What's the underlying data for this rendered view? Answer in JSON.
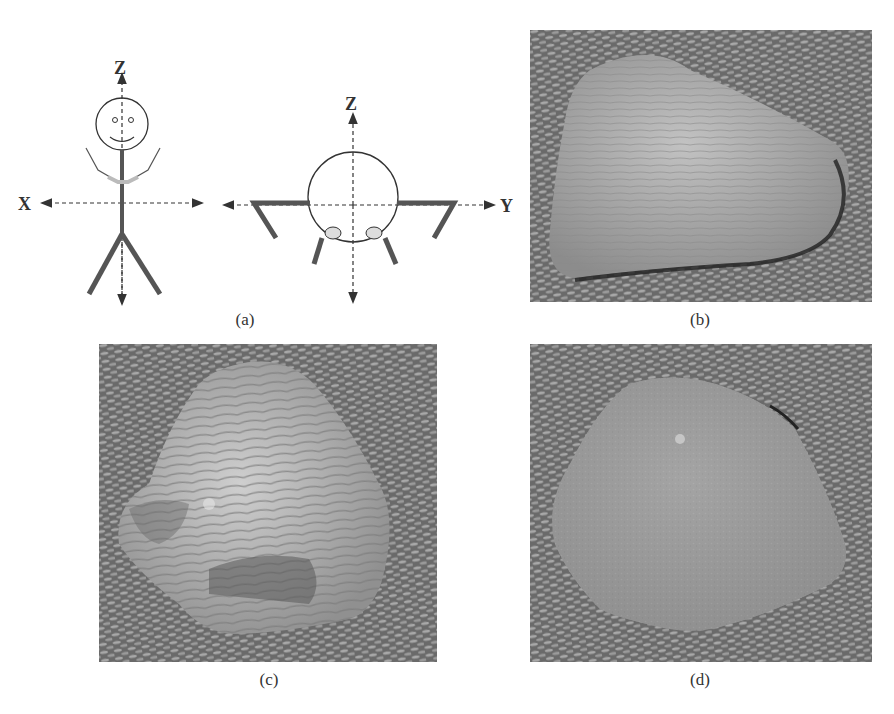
{
  "figure": {
    "panels": [
      {
        "id": "a",
        "caption": "(a)",
        "type": "diagram",
        "description": "Stick figure coordinate axes: front view (X-Z) and top view (Y-Z)",
        "left_view": {
          "axis_labels": {
            "vertical": "Z",
            "horizontal": "X"
          }
        },
        "right_view": {
          "axis_labels": {
            "vertical": "Z",
            "horizontal": "Y"
          }
        }
      },
      {
        "id": "b",
        "caption": "(b)",
        "type": "photo",
        "description": "Flat rounded stone with fine horizontal striations on woven fabric"
      },
      {
        "id": "c",
        "caption": "(c)",
        "type": "photo",
        "description": "Pointed stone with pronounced curved striations and fractured face on woven fabric"
      },
      {
        "id": "d",
        "caption": "(d)",
        "type": "photo",
        "description": "Smooth granular rounded stone on woven fabric"
      }
    ]
  },
  "colors": {
    "line": "#333333",
    "limb": "#555555",
    "fabric_dark": "#5a5a5a",
    "fabric_light": "#a8a8a8",
    "stone_b": "#aaaaaa",
    "stone_c": "#b2b2b2",
    "stone_d": "#9c9c9c"
  }
}
